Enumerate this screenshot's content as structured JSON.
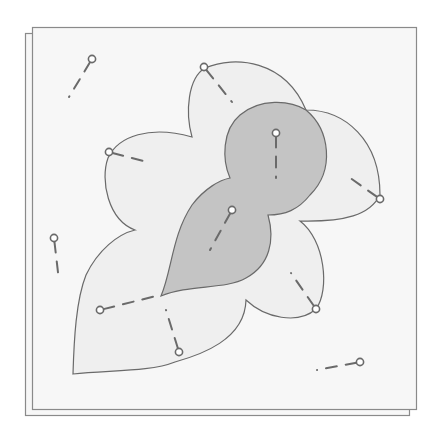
{
  "diagram": {
    "colors": {
      "background": "#ffffff",
      "sheet_fill": "#f7f7f7",
      "sheet_stroke": "#8a8a8a",
      "outer_region_fill": "#efefef",
      "inner_region_fill": "#c4c4c4",
      "outline": "#6a6a6a",
      "pin_stroke": "#6a6a6a",
      "pin_head_fill": "#ffffff"
    },
    "regions": [
      {
        "name": "outer-scalloped-region",
        "lobes": 6,
        "style": "light"
      },
      {
        "name": "inner-region",
        "lobes": 3,
        "style": "dark"
      }
    ],
    "pins": [
      {
        "name": "pin-top-left-outside",
        "placement": "outside"
      },
      {
        "name": "pin-top-lobe",
        "placement": "on-outline"
      },
      {
        "name": "pin-left-upper-lobe",
        "placement": "on-outline"
      },
      {
        "name": "pin-inner-top",
        "placement": "inside-dark"
      },
      {
        "name": "pin-inner-middle",
        "placement": "inside-dark"
      },
      {
        "name": "pin-right-lobe",
        "placement": "on-outline"
      },
      {
        "name": "pin-left-outside",
        "placement": "outside"
      },
      {
        "name": "pin-lower-left",
        "placement": "inside-light"
      },
      {
        "name": "pin-lower-middle",
        "placement": "inside-light"
      },
      {
        "name": "pin-lower-right-lobe",
        "placement": "on-outline"
      },
      {
        "name": "pin-bottom-right-outside",
        "placement": "outside"
      }
    ]
  }
}
